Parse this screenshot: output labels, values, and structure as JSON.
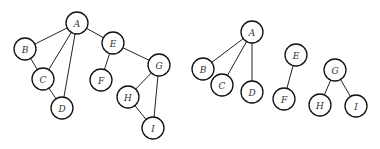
{
  "graphs": [
    {
      "name": "graph-left",
      "radius": 11,
      "nodes": [
        {
          "id": "A",
          "label": "A",
          "x": 77,
          "y": 23
        },
        {
          "id": "B",
          "label": "B",
          "x": 25,
          "y": 49
        },
        {
          "id": "C",
          "label": "C",
          "x": 43,
          "y": 79
        },
        {
          "id": "D",
          "label": "D",
          "x": 62,
          "y": 108
        },
        {
          "id": "E",
          "label": "E",
          "x": 113,
          "y": 43
        },
        {
          "id": "F",
          "label": "F",
          "x": 101,
          "y": 80
        },
        {
          "id": "G",
          "label": "G",
          "x": 159,
          "y": 65
        },
        {
          "id": "H",
          "label": "H",
          "x": 128,
          "y": 97
        },
        {
          "id": "I",
          "label": "I",
          "x": 153,
          "y": 128
        }
      ],
      "edges": [
        [
          "A",
          "B"
        ],
        [
          "A",
          "C"
        ],
        [
          "A",
          "D"
        ],
        [
          "A",
          "E"
        ],
        [
          "B",
          "C"
        ],
        [
          "C",
          "D"
        ],
        [
          "E",
          "F"
        ],
        [
          "E",
          "G"
        ],
        [
          "G",
          "H"
        ],
        [
          "G",
          "I"
        ],
        [
          "H",
          "I"
        ]
      ]
    },
    {
      "name": "graph-right",
      "radius": 11,
      "nodes": [
        {
          "id": "A",
          "label": "A",
          "x": 252,
          "y": 32
        },
        {
          "id": "B",
          "label": "B",
          "x": 203,
          "y": 69
        },
        {
          "id": "C",
          "label": "C",
          "x": 222,
          "y": 85
        },
        {
          "id": "D",
          "label": "D",
          "x": 252,
          "y": 92
        },
        {
          "id": "E",
          "label": "E",
          "x": 296,
          "y": 55
        },
        {
          "id": "F",
          "label": "F",
          "x": 284,
          "y": 99
        },
        {
          "id": "G",
          "label": "G",
          "x": 335,
          "y": 70
        },
        {
          "id": "H",
          "label": "H",
          "x": 320,
          "y": 105
        },
        {
          "id": "I",
          "label": "I",
          "x": 356,
          "y": 106
        }
      ],
      "edges": [
        [
          "A",
          "B"
        ],
        [
          "A",
          "C"
        ],
        [
          "A",
          "D"
        ],
        [
          "E",
          "F"
        ],
        [
          "G",
          "H"
        ],
        [
          "G",
          "I"
        ]
      ]
    }
  ]
}
